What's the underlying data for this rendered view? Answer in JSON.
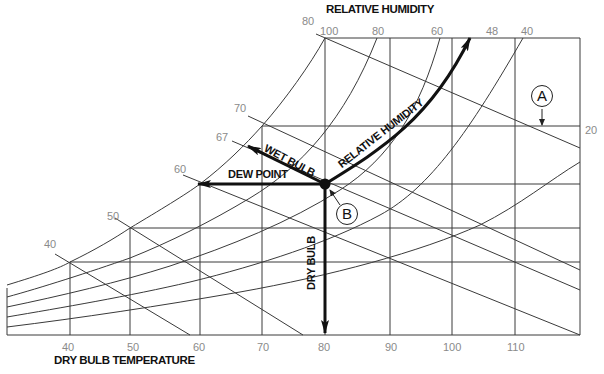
{
  "title_top": "RELATIVE HUMIDITY",
  "title_bottom": "DRY BULB TEMPERATURE",
  "x_ticks": [
    {
      "label": "40",
      "x": 70
    },
    {
      "label": "50",
      "x": 130
    },
    {
      "label": "60",
      "x": 200
    },
    {
      "label": "70",
      "x": 265
    },
    {
      "label": "80",
      "x": 325
    },
    {
      "label": "90",
      "x": 390
    },
    {
      "label": "100",
      "x": 452
    },
    {
      "label": "110",
      "x": 515
    }
  ],
  "saturation_labels": [
    {
      "label": "40",
      "x": 44,
      "y": 238
    },
    {
      "label": "50",
      "x": 107,
      "y": 210
    },
    {
      "label": "60",
      "x": 174,
      "y": 163
    },
    {
      "label": "67",
      "x": 216,
      "y": 131
    },
    {
      "label": "70",
      "x": 234,
      "y": 102
    },
    {
      "label": "80",
      "x": 302,
      "y": 15
    }
  ],
  "rh_labels": [
    {
      "label": "100",
      "x": 318,
      "y": 26
    },
    {
      "label": "80",
      "x": 372,
      "y": 26
    },
    {
      "label": "60",
      "x": 431,
      "y": 26
    },
    {
      "label": "48",
      "x": 486,
      "y": 26
    },
    {
      "label": "40",
      "x": 521,
      "y": 26
    },
    {
      "label": "20",
      "x": 586,
      "y": 124
    }
  ],
  "annotations": {
    "dew_point": "DEW POINT",
    "wet_bulb": "WET BULB",
    "relative_humidity": "RELATIVE HUMIDITY",
    "dry_bulb": "DRY BULB",
    "callout_a": "A",
    "callout_b": "B"
  },
  "state_point": {
    "dry_bulb": 80,
    "wet_bulb": 67,
    "dew_point": 60,
    "relative_humidity": 48
  }
}
